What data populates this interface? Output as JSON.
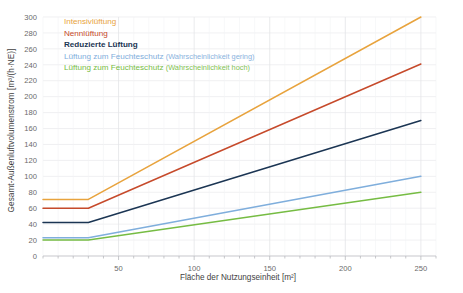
{
  "chart_data": {
    "type": "line",
    "title": "",
    "xlabel": "Fläche der Nutzungseinheit [m²]",
    "ylabel": "Gesamt-Außenluftvolumenstrom [m³/(h·NE)]",
    "xlim": [
      0,
      260
    ],
    "ylim": [
      0,
      300
    ],
    "xticks": [
      50,
      100,
      150,
      200,
      250
    ],
    "yticks": [
      0,
      20,
      40,
      60,
      80,
      100,
      120,
      140,
      160,
      180,
      200,
      220,
      240,
      260,
      280,
      300
    ],
    "xtick_labels": [
      "50",
      "100",
      "150",
      "200",
      "250"
    ],
    "ytick_labels": [
      "0",
      "20",
      "40",
      "60",
      "80",
      "100",
      "120",
      "140",
      "160",
      "180",
      "200",
      "220",
      "240",
      "260",
      "280",
      "300"
    ],
    "grid": true,
    "legend_position": "upper-left-inside",
    "x": [
      0,
      30,
      250
    ],
    "series": [
      {
        "name": "Intensivlüftung",
        "label": "Intensivlüftung",
        "sublabel": "",
        "color": "#E8A33D",
        "values": [
          71,
          71,
          300
        ]
      },
      {
        "name": "Nennlüftung",
        "label": "Nennlüftung",
        "sublabel": "",
        "color": "#C64A2B",
        "values": [
          60,
          60,
          241
        ]
      },
      {
        "name": "Reduzierte Lüftung",
        "label": "Reduzierte Lüftung",
        "sublabel": "",
        "color": "#1B3553",
        "values": [
          42,
          42,
          170
        ]
      },
      {
        "name": "Lüftung zum Feuchteschutz (Wahrscheinlichkeit gering)",
        "label": "Lüftung zum Feuchteschutz ",
        "sublabel": "(Wahrscheinlichkeit gering)",
        "color": "#7FAEDC",
        "values": [
          23,
          23,
          100
        ]
      },
      {
        "name": "Lüftung zum Feuchteschutz (Wahrscheinlichkeit hoch)",
        "label": "Lüftung zum Feuchteschutz ",
        "sublabel": "(Wahrscheinlichkeit hoch)",
        "color": "#76BC43",
        "values": [
          20,
          20,
          80
        ]
      }
    ]
  }
}
